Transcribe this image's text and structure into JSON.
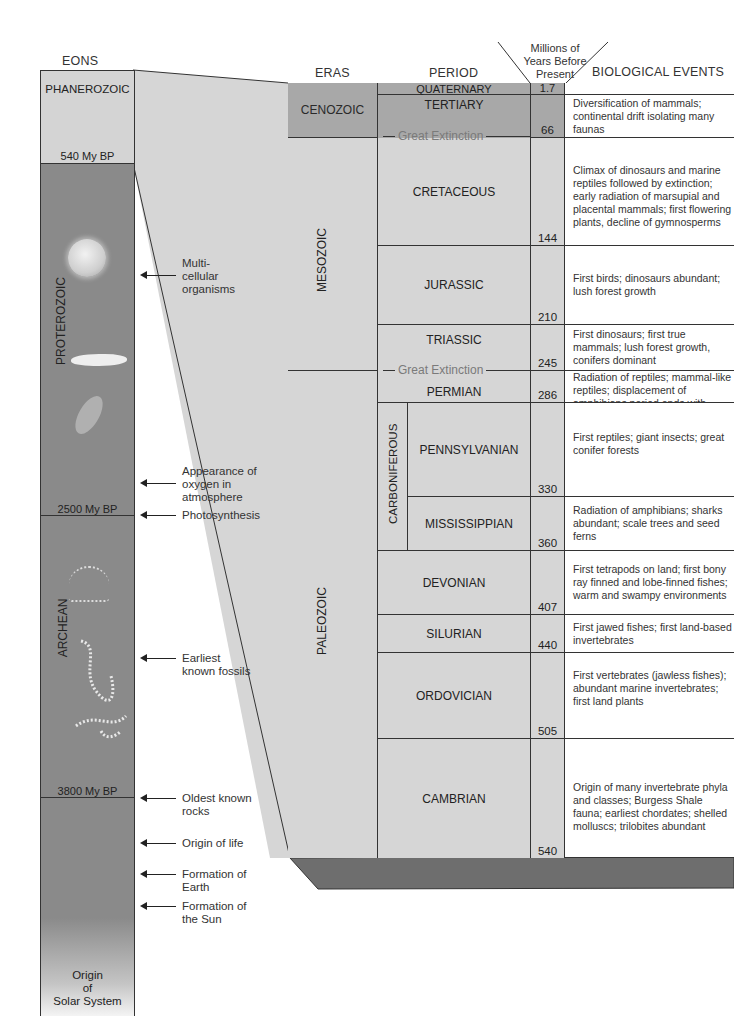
{
  "headers": {
    "eons": "EONS",
    "eras": "ERAS",
    "period": "PERIOD",
    "years": "Millions of Years Before Present",
    "years_lines": [
      "Millions of",
      "Years Before",
      "Present"
    ],
    "events": "BIOLOGICAL EVENTS"
  },
  "eons": [
    {
      "name": "PHANEROZOIC",
      "boundary_bottom": "540 My BP"
    },
    {
      "name": "PROTEROZOIC",
      "boundary_bottom": "2500 My BP"
    },
    {
      "name": "ARCHEAN",
      "boundary_bottom": "3800 My BP"
    },
    {
      "name": "",
      "bottom_label": "Origin of Solar System",
      "bottom_lines": [
        "Origin",
        "of",
        "Solar System"
      ]
    }
  ],
  "annotations": [
    {
      "text": "Multi- cellular organisms",
      "lines": [
        "Multi-",
        "cellular",
        "organisms"
      ]
    },
    {
      "text": "Appearance of oxygen in atmosphere",
      "lines": [
        "Appearance of",
        "oxygen in",
        "atmosphere"
      ]
    },
    {
      "text": "Photosynthesis",
      "lines": [
        "Photosynthesis"
      ]
    },
    {
      "text": "Earliest known fossils",
      "lines": [
        "Earliest",
        "known fossils"
      ]
    },
    {
      "text": "Oldest known rocks",
      "lines": [
        "Oldest known",
        "rocks"
      ]
    },
    {
      "text": "Origin of life",
      "lines": [
        "Origin of life"
      ]
    },
    {
      "text": "Formation of Earth",
      "lines": [
        "Formation of",
        "Earth"
      ]
    },
    {
      "text": "Formation of the Sun",
      "lines": [
        "Formation of",
        "the Sun"
      ]
    }
  ],
  "eras": [
    {
      "name": "CENOZOIC"
    },
    {
      "name": "MESOZOIC"
    },
    {
      "name": "PALEOZOIC"
    }
  ],
  "sub_period_group": "CARBONIFEROUS",
  "extinction_label": "Great Extinction",
  "periods": [
    {
      "name": "QUATERNARY",
      "mya": "1.7",
      "events": ""
    },
    {
      "name": "TERTIARY",
      "mya": "66",
      "events": "Diversification of mammals; continental drift isolating many faunas"
    },
    {
      "name": "CRETACEOUS",
      "mya": "144",
      "events": "Climax of dinosaurs and marine reptiles followed by extinction; early radiation of marsupial and placental mammals; first flowering plants, decline of gymnosperms"
    },
    {
      "name": "JURASSIC",
      "mya": "210",
      "events": "First birds; dinosaurs abundant; lush forest growth"
    },
    {
      "name": "TRIASSIC",
      "mya": "245",
      "events": "First dinosaurs; first true mammals; lush forest growth, conifers dominant"
    },
    {
      "name": "PERMIAN",
      "mya": "286",
      "events": "Radiation of reptiles; mammal-like reptiles; displacement of amphibians period ends with mass extinction"
    },
    {
      "name": "PENNSYLVANIAN",
      "mya": "330",
      "events": "First reptiles; giant insects; great conifer forests"
    },
    {
      "name": "MISSISSIPPIAN",
      "mya": "360",
      "events": "Radiation of amphibians; sharks abundant; scale trees and seed ferns"
    },
    {
      "name": "DEVONIAN",
      "mya": "407",
      "events": "First tetrapods on land; first bony ray finned and lobe-finned fishes; warm and swampy environments"
    },
    {
      "name": "SILURIAN",
      "mya": "440",
      "events": "First jawed fishes; first land-based invertebrates"
    },
    {
      "name": "ORDOVICIAN",
      "mya": "505",
      "events": "First vertebrates (jawless fishes); abundant marine invertebrates; first land plants"
    },
    {
      "name": "CAMBRIAN",
      "mya": "540",
      "events": "Origin of many invertebrate phyla and classes; Burgess Shale fauna; earliest chordates; shelled molluscs; trilobites abundant"
    }
  ],
  "colors": {
    "phanerozoic": "#d4d4d4",
    "proterozoic_archean": "#8a8a8a",
    "cenozoic": "#a8a8a8",
    "mesozoic_paleozoic": "#d6d6d6",
    "slab": "#6e6e6e",
    "extinction_text": "#7a7a7a"
  }
}
